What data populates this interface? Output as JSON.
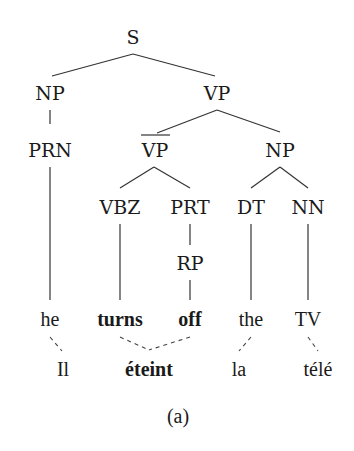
{
  "diagram": {
    "caption": "(a)",
    "tree": {
      "S": "S",
      "NP_left": "NP",
      "VP": "VP",
      "PRN": "PRN",
      "VP_bar": "VP",
      "NP_right": "NP",
      "VBZ": "VBZ",
      "PRT": "PRT",
      "DT": "DT",
      "NN": "NN",
      "RP": "RP"
    },
    "source_words": [
      {
        "text": "he",
        "bold": false
      },
      {
        "text": "turns",
        "bold": true
      },
      {
        "text": "off",
        "bold": true
      },
      {
        "text": "the",
        "bold": false
      },
      {
        "text": "TV",
        "bold": false
      }
    ],
    "target_words": [
      {
        "text": "Il",
        "bold": false
      },
      {
        "text": "éteint",
        "bold": true
      },
      {
        "text": "la",
        "bold": false
      },
      {
        "text": "télé",
        "bold": false
      }
    ],
    "alignments": [
      [
        "he",
        "Il"
      ],
      [
        "turns",
        "éteint"
      ],
      [
        "off",
        "éteint"
      ],
      [
        "the",
        "la"
      ],
      [
        "TV",
        "télé"
      ]
    ]
  }
}
